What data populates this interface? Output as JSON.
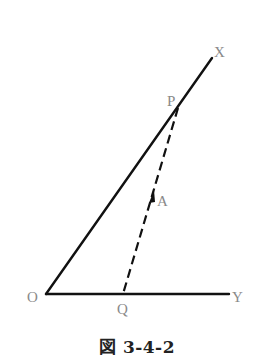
{
  "figure": {
    "caption": "図 3-4-2",
    "points": {
      "O": {
        "label": "O",
        "x": 46,
        "y": 294
      },
      "X": {
        "label": "X",
        "x": 212,
        "y": 58
      },
      "Y": {
        "label": "Y",
        "x": 229,
        "y": 294
      },
      "P": {
        "label": "P",
        "x": 178,
        "y": 108
      },
      "Q": {
        "label": "Q",
        "x": 123,
        "y": 294
      },
      "A": {
        "label": "A",
        "x": 151,
        "y": 200
      }
    },
    "segments": [
      {
        "from": "O",
        "to": "X",
        "style": "solid"
      },
      {
        "from": "O",
        "to": "Y",
        "style": "solid"
      },
      {
        "from": "P",
        "to": "Q",
        "style": "dashed"
      }
    ],
    "arrow": {
      "at": "A",
      "direction": "toward P"
    },
    "colors": {
      "line": "#111111",
      "label": "#8a8a8a"
    }
  }
}
